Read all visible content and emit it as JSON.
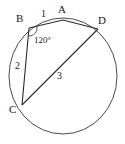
{
  "figure": {
    "stroke_color": "#4a4a4a",
    "chord_color": "#2b2b2b",
    "label_color": "#1a1a1a",
    "background": "#ffffff"
  },
  "circle": {
    "center_x": 63,
    "center_y": 76,
    "radius_x": 54,
    "radius_y": 58
  },
  "vertices": [
    {
      "id": "A",
      "label": "A",
      "x": 63,
      "y": 20,
      "label_x": 58,
      "label_y": 4
    },
    {
      "id": "B",
      "label": "B",
      "x": 29,
      "y": 28,
      "label_x": 16,
      "label_y": 13
    },
    {
      "id": "C",
      "label": "C",
      "x": 22,
      "y": 105,
      "label_x": 9,
      "label_y": 104
    },
    {
      "id": "D",
      "label": "D",
      "x": 98,
      "y": 29,
      "label_x": 98,
      "label_y": 15
    }
  ],
  "chords": [
    {
      "id": "BA",
      "from": "B",
      "to": "A",
      "label": "1",
      "label_x": 41,
      "label_y": 9
    },
    {
      "id": "BC",
      "from": "B",
      "to": "C",
      "label": "2",
      "label_x": 15,
      "label_y": 61
    },
    {
      "id": "CD",
      "from": "C",
      "to": "D",
      "label": "3",
      "label_x": 57,
      "label_y": 71
    },
    {
      "id": "AD",
      "from": "A",
      "to": "D",
      "label": "",
      "label_x": 0,
      "label_y": 0
    }
  ],
  "angle": {
    "at_vertex": "B",
    "label": "120°",
    "label_x": 34,
    "label_y": 36,
    "arc_cx": 29,
    "arc_cy": 28,
    "arc_radius": 8
  }
}
